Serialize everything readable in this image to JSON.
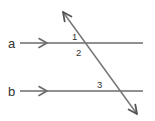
{
  "figure": {
    "background_color": "#ffffff",
    "line_color": "#6b6b6b",
    "transversal_color": "#777777",
    "label_color": "#333333",
    "width": 155,
    "height": 121
  },
  "lines": [
    {
      "id": "line-a",
      "label": "a",
      "label_x": 8,
      "label_y": 48,
      "x1": 20,
      "y1": 43,
      "x2": 143,
      "y2": 43,
      "direction_marker": "single-chevron-right",
      "marker_x": 43
    },
    {
      "id": "line-b",
      "label": "b",
      "label_x": 8,
      "label_y": 96,
      "x1": 20,
      "y1": 91,
      "x2": 143,
      "y2": 91,
      "direction_marker": "single-chevron-right",
      "marker_x": 43
    }
  ],
  "transversal": {
    "id": "transversal-line",
    "x1": 63,
    "y1": 12,
    "x2": 137,
    "y2": 114,
    "arrow_start": "up-left",
    "arrow_end": "down-right"
  },
  "intersections": [
    {
      "id": "intersection-a",
      "x": 85,
      "y": 43,
      "with": "line-a"
    },
    {
      "id": "intersection-b",
      "x": 112,
      "y": 91,
      "with": "line-b"
    }
  ],
  "angle_labels": [
    {
      "id": "angle-1",
      "text": "1",
      "x": 72,
      "y": 40
    },
    {
      "id": "angle-2",
      "text": "2",
      "x": 76,
      "y": 56
    },
    {
      "id": "angle-3",
      "text": "3",
      "x": 97,
      "y": 88
    }
  ]
}
